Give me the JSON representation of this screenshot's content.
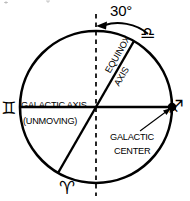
{
  "diagram": {
    "angle_label": "30°",
    "labels": {
      "galactic_axis": "GALACTIC AXIS",
      "unmoving": "(UNMOVING)",
      "equinox_axis_line1": "EQUINOX",
      "equinox_axis_line2": "AXIS",
      "galactic_center_line1": "GALACTIC",
      "galactic_center_line2": "CENTER"
    },
    "zodiac_glyphs": [
      {
        "name": "gemini",
        "glyph": "♊",
        "position": "left"
      },
      {
        "name": "libra",
        "glyph": "♎",
        "position": "upper-right"
      },
      {
        "name": "sagittarius",
        "glyph": "♐",
        "position": "right"
      },
      {
        "name": "aries",
        "glyph": "♈",
        "position": "bottom"
      }
    ],
    "colors": {
      "stroke": "#000000",
      "background": "#ffffff"
    },
    "geometry": {
      "circle_center_x": 96,
      "circle_center_y": 107,
      "circle_radius": 76,
      "galactic_axis_angle_deg": 0,
      "equinox_axis_angle_deg": 60,
      "vertical_dashed_axis": true,
      "galactic_center_marker": "filled-dot-right"
    }
  }
}
